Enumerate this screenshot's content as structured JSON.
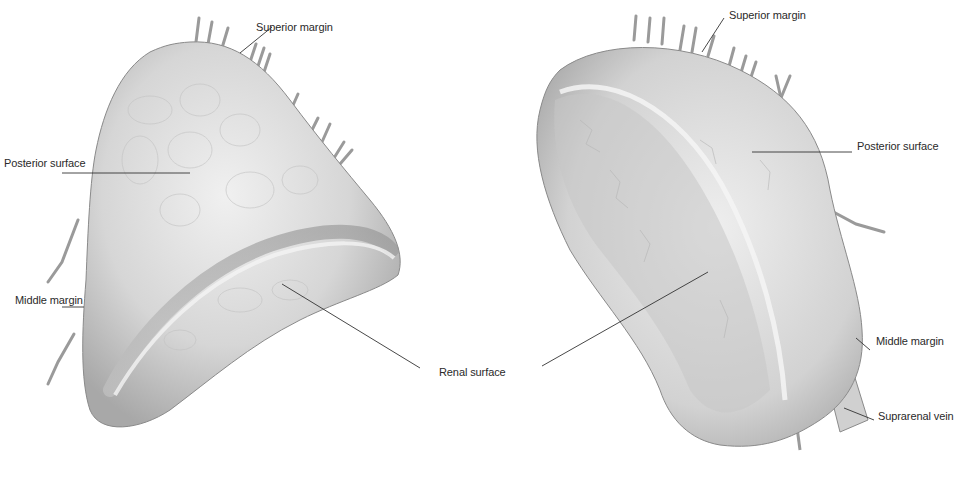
{
  "figure": {
    "type": "anatomical-illustration",
    "colors": {
      "background": "#ffffff",
      "gland_fill": "#dcdcdc",
      "gland_shade": "#9a9a9a",
      "gland_highlight": "#f2f2f2",
      "leader_line": "#333333",
      "label_text": "#2a2a2a"
    }
  },
  "left_gland": {
    "labels": {
      "superior_margin": "Superior margin",
      "posterior_surface": "Posterior surface",
      "middle_margin": "Middle margin"
    }
  },
  "shared_labels": {
    "renal_surface": "Renal surface"
  },
  "right_gland": {
    "labels": {
      "superior_margin": "Superior margin",
      "posterior_surface": "Posterior surface",
      "middle_margin": "Middle margin",
      "suprarenal_vein": "Suprarenal vein"
    }
  }
}
